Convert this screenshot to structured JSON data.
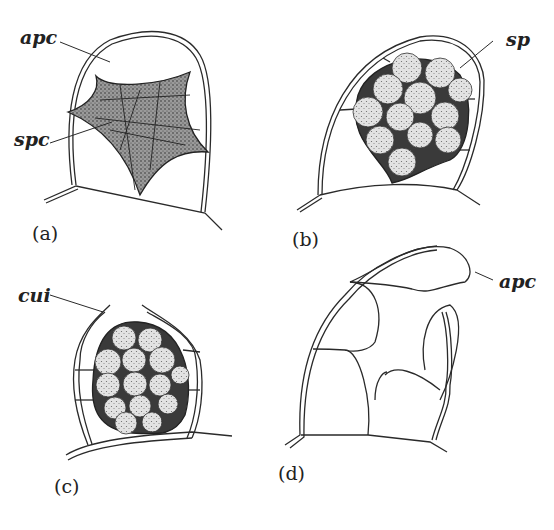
{
  "figure": {
    "panels": [
      {
        "id": "a",
        "label": "(a)",
        "annotations": [
          "apc",
          "spc"
        ]
      },
      {
        "id": "b",
        "label": "(b)",
        "annotations": [
          "sp"
        ]
      },
      {
        "id": "c",
        "label": "(c)",
        "annotations": [
          "cui"
        ]
      },
      {
        "id": "d",
        "label": "(d)",
        "annotations": [
          "apc"
        ]
      }
    ],
    "terms": {
      "a_apc": "apc",
      "a_spc": "spc",
      "b_sp": "sp",
      "c_cui": "cui",
      "d_apc": "apc"
    },
    "colors": {
      "line": "#2a2a2a",
      "stipple_dark": "#555555",
      "spore_fill": "#bdbdbd"
    }
  }
}
